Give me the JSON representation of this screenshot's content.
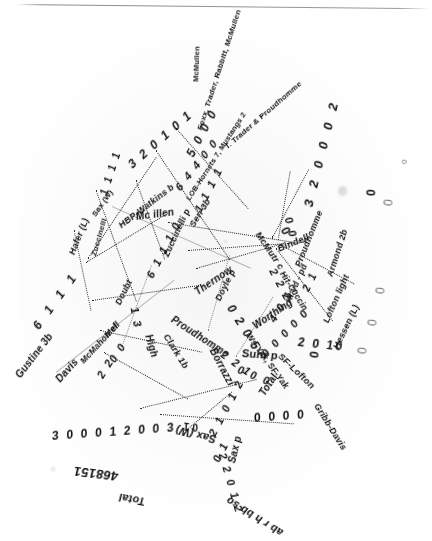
{
  "document": {
    "kind": "warped-scanned-box-score",
    "note": "Heavily distorted radial scan of a baseball box score",
    "background_color": "#ffffff",
    "ink_color": "#111111"
  },
  "headers": {
    "column_row": "ab r h bb so",
    "totals_label_left": "Total",
    "totals_label_right": "Total",
    "totals_figures": "468151"
  },
  "players": {
    "left_column": [
      {
        "name": "Gustine 3b",
        "line": "6 1 1 1"
      },
      {
        "name": "Hafer (L)",
        "line": ""
      },
      {
        "name": "Zuccinelli",
        "line": ""
      },
      {
        "name": "Davis",
        "line": ""
      },
      {
        "name": "McMahon cf",
        "line": "2 2"
      },
      {
        "name": "Doubt",
        "line": ""
      },
      {
        "name": "Mell",
        "line": "0 0"
      },
      {
        "name": "Seri 3b",
        "line": "1 1 1 1"
      },
      {
        "name": "Mc illen",
        "line": ""
      },
      {
        "name": "Zuccinelli p",
        "line": "6 1 1 1 0"
      }
    ],
    "center_column": [
      {
        "name": "Thernow",
        "line": ""
      },
      {
        "name": "Doyle p",
        "line": "0 2 0 5"
      },
      {
        "name": "Proudhomme",
        "line": "2 2 1"
      },
      {
        "name": "Clark 1b",
        "line": ""
      },
      {
        "name": "High",
        "line": "1 3"
      },
      {
        "name": "Suhr p",
        "line": "0 0 0"
      },
      {
        "name": "Borrazzi",
        "line": ""
      },
      {
        "name": "Worthing",
        "line": ""
      },
      {
        "name": "Hit-Cuccin",
        "line": "2 2 2"
      },
      {
        "name": "Bindell",
        "line": "0 0"
      }
    ],
    "right_column": [
      {
        "name": "McMutr c",
        "line": "0"
      },
      {
        "name": "Armond 2b",
        "line": "2 1"
      },
      {
        "name": "Lofton light",
        "line": "2 0 10"
      },
      {
        "name": "Hessen (L)",
        "line": "0"
      },
      {
        "name": "SF-Lofton",
        "line": "0 0 0 0"
      },
      {
        "name": "Gribb-Davis",
        "line": ""
      },
      {
        "name": "Ws-Yak, SF-Yak",
        "line": ""
      },
      {
        "name": "Kr'yd - pd",
        "line": "4 0 1"
      },
      {
        "name": "Sax (W)",
        "line": "2 2 0 1 2"
      },
      {
        "name": "Sax p",
        "line": "0 1"
      }
    ]
  },
  "notes": {
    "hbp": "HBP-Watkins b",
    "lob": "LOB-Hornets 7, Mustangs 2",
    "sb": "Foxx, Trader, Rabbitt, McMullen",
    "dp": "T. Trader & Proudhomme",
    "trailing_name": "McMullen"
  },
  "stat_lines": {
    "a": "3 2 0 1 0 1",
    "b": "5 0 0 0",
    "c": "6 4 4 0 0",
    "d": "3 2 0 0 0 2",
    "e": "3 0 0 0 1 2 0 0 3",
    "f": "0 0 0 0",
    "g": "2 1 0 1 2",
    "h": "2 2 0 1 2",
    "i": "0 0 0 0 0",
    "j": "2 2 1",
    "k": "0 2 0 5",
    "l": "1 3",
    "m": "0",
    "n": "2 1",
    "o": "1 1 1 1",
    "p": "2 0 10",
    "q": "6 1 1 1",
    "r": "0 0"
  }
}
